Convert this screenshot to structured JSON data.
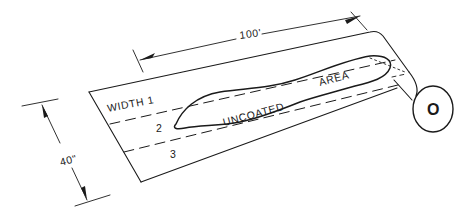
{
  "diagram": {
    "type": "technical line drawing",
    "labels": {
      "length_dimension": "100'",
      "width_dimension": "40\"",
      "width_1": "WIDTH  1",
      "width_2": "2",
      "width_3": "3",
      "uncoated": "UNCOATED",
      "area": "AREA",
      "roll_mark": "O"
    },
    "colors": {
      "ink": "#1a1a1a",
      "background": "#ffffff"
    }
  }
}
